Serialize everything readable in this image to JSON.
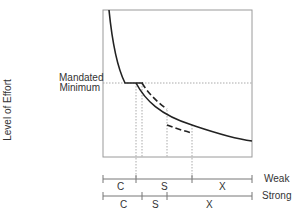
{
  "diagram": {
    "y_axis_label": "Level of Effort",
    "reference_line_label_1": "Mandated",
    "reference_line_label_2": "Minimum",
    "scales": [
      {
        "name": "Weak",
        "segments": [
          {
            "label": "C"
          },
          {
            "label": "S"
          },
          {
            "label": "X"
          }
        ]
      },
      {
        "name": "Strong",
        "segments": [
          {
            "label": "C"
          },
          {
            "label": "S"
          },
          {
            "label": "X"
          }
        ]
      }
    ],
    "colors": {
      "curve": "#222222",
      "frame": "#999999",
      "dotted": "#aaaaaa",
      "text": "#333333"
    }
  }
}
